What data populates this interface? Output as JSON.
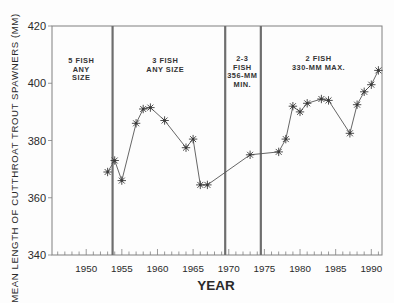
{
  "chart_data": {
    "type": "line",
    "title": "",
    "xlabel": "YEAR",
    "ylabel": "MEAN LENGTH OF CUTTHROAT TROUT SPAWNERS (MM)",
    "xlim": [
      1945.2,
      1991.5
    ],
    "ylim": [
      340,
      420
    ],
    "x_ticks": [
      1950,
      1955,
      1960,
      1965,
      1970,
      1975,
      1980,
      1985,
      1990
    ],
    "y_ticks": [
      340,
      360,
      380,
      400,
      420
    ],
    "grid": false,
    "legend": null,
    "marker": "asterisk",
    "series": [
      {
        "name": "Mean length",
        "x": [
          1953,
          1954,
          1955,
          1957,
          1958,
          1959,
          1961,
          1964,
          1965,
          1966,
          1967,
          1973,
          1977,
          1978,
          1979,
          1980,
          1981,
          1983,
          1984,
          1987,
          1988,
          1989,
          1990,
          1991
        ],
        "y": [
          369,
          373,
          366,
          386,
          391,
          391.5,
          387,
          377.5,
          380.5,
          364.5,
          364.5,
          375,
          376,
          380.5,
          392,
          390,
          393,
          394.5,
          394,
          382.5,
          392.5,
          397,
          399.5,
          404.5
        ]
      }
    ],
    "regulation_boundaries": [
      1953.7,
      1969.5,
      1974.5
    ],
    "annotations": [
      {
        "lines": [
          "5 FISH",
          "ANY",
          "SIZE"
        ],
        "x": 1949.3,
        "y": 407
      },
      {
        "lines": [
          "3 FISH",
          "ANY SIZE"
        ],
        "x": 1961.1,
        "y": 407
      },
      {
        "lines": [
          "2-3",
          "FISH",
          "356-MM",
          "MIN."
        ],
        "x": 1971.9,
        "y": 407.6
      },
      {
        "lines": [
          "2 FISH",
          "330-MM MAX."
        ],
        "x": 1982.6,
        "y": 407.6
      }
    ]
  },
  "style": {
    "line_color": "#555555",
    "frame_color": "#808080",
    "divider_color": "#6e6e6e",
    "marker_color": "#3a3a3a",
    "text_color": "#2a2a2a"
  }
}
